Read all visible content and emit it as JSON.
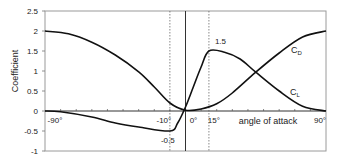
{
  "chart_data": {
    "type": "line",
    "title": "",
    "xlabel": "angle of attack",
    "ylabel": "Coefficient",
    "xlim": [
      -90,
      90
    ],
    "ylim": [
      -1,
      2.5
    ],
    "grid": false,
    "legend": "inline labels",
    "y_ticks": [
      "2.5",
      "2",
      "1.5",
      "1",
      "0.5",
      "0",
      "-0.5",
      "-1"
    ],
    "y_tick_values": [
      2.5,
      2,
      1.5,
      1,
      0.5,
      0,
      -0.5,
      -1
    ],
    "x_tick_labels": [
      {
        "angle": -90,
        "label": "-90°"
      },
      {
        "angle": -10,
        "label": "-10°"
      },
      {
        "angle": 0,
        "label": "0°"
      },
      {
        "angle": 15,
        "label": "15°"
      },
      {
        "angle": 90,
        "label": "90°"
      }
    ],
    "reference_lines": [
      {
        "angle": -10,
        "style": "dashed"
      },
      {
        "angle": 0,
        "style": "solid"
      },
      {
        "angle": 15,
        "style": "dashed"
      }
    ],
    "annotations": [
      {
        "text": "1.5",
        "angle": 15,
        "value": 1.5
      },
      {
        "text": "-0.5",
        "angle": -10,
        "value": -0.5
      }
    ],
    "series": [
      {
        "name": "CD",
        "label_main": "C",
        "label_sub": "D",
        "x": [
          -90,
          -75,
          -60,
          -45,
          -30,
          -20,
          -10,
          0,
          10,
          20,
          30,
          45,
          60,
          75,
          90
        ],
        "values": [
          2.0,
          1.93,
          1.72,
          1.4,
          0.98,
          0.6,
          0.2,
          0.02,
          0.05,
          0.18,
          0.45,
          0.97,
          1.45,
          1.85,
          2.0
        ]
      },
      {
        "name": "CL",
        "label_main": "C",
        "label_sub": "L",
        "x": [
          -90,
          -80,
          -60,
          -45,
          -30,
          -10,
          -5,
          0,
          5,
          10,
          15,
          25,
          35,
          45,
          60,
          75,
          90
        ],
        "values": [
          0,
          -0.02,
          -0.15,
          -0.3,
          -0.4,
          -0.5,
          -0.3,
          0.1,
          0.6,
          1.1,
          1.5,
          1.47,
          1.3,
          0.97,
          0.5,
          0.12,
          0
        ]
      }
    ]
  }
}
